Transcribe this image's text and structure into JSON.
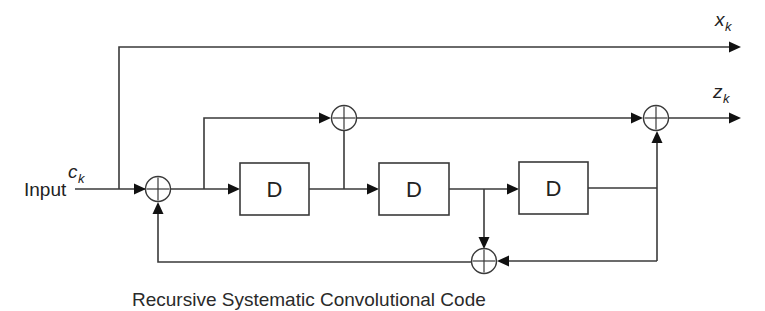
{
  "diagram": {
    "title": "Recursive Systematic Convolutional Code",
    "input": {
      "label": "Input",
      "symbol": "c",
      "subscript": "k"
    },
    "outputs": [
      {
        "id": "systematic",
        "symbol": "x",
        "subscript": "k"
      },
      {
        "id": "parity",
        "symbol": "z",
        "subscript": "k"
      }
    ],
    "delay_elements": [
      {
        "id": "d1",
        "label": "D"
      },
      {
        "id": "d2",
        "label": "D"
      },
      {
        "id": "d3",
        "label": "D"
      }
    ],
    "adders": [
      {
        "id": "feedback-adder",
        "symbol": "⊕",
        "inputs": [
          "input",
          "feedback"
        ]
      },
      {
        "id": "parity-tap-adder",
        "symbol": "⊕",
        "inputs": [
          "feedback-adder-out",
          "d1-out"
        ]
      },
      {
        "id": "parity-output-adder",
        "symbol": "⊕",
        "inputs": [
          "parity-tap-adder-out",
          "d3-out"
        ]
      },
      {
        "id": "feedback-sum-adder",
        "symbol": "⊕",
        "inputs": [
          "d2-out",
          "d3-out"
        ]
      }
    ],
    "colors": {
      "line": "#3a3a3a",
      "arrow": "#111111",
      "text": "#222222",
      "background": "#ffffff"
    }
  }
}
